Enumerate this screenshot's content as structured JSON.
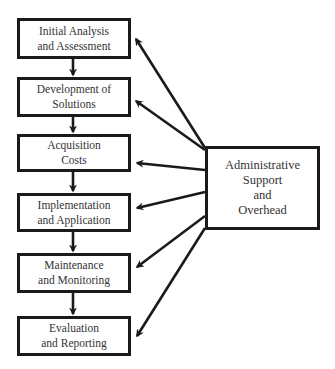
{
  "diagram": {
    "type": "process-flow",
    "stroke_color": "#1a1a1a",
    "text_color": "#333333",
    "background": "#ffffff",
    "steps": [
      {
        "id": "step-1",
        "line1": "Initial Analysis",
        "line2": "and Assessment"
      },
      {
        "id": "step-2",
        "line1": "Development of",
        "line2": "Solutions"
      },
      {
        "id": "step-3",
        "line1": "Acquisition",
        "line2": "Costs"
      },
      {
        "id": "step-4",
        "line1": "Implementation",
        "line2": "and Application"
      },
      {
        "id": "step-5",
        "line1": "Maintenance",
        "line2": "and Monitoring"
      },
      {
        "id": "step-6",
        "line1": "Evaluation",
        "line2": "and Reporting"
      }
    ],
    "support": {
      "id": "admin",
      "lines": [
        "Administrative",
        "Support",
        "and",
        "Overhead"
      ]
    },
    "edges": [
      {
        "from": "step-1",
        "to": "step-2"
      },
      {
        "from": "step-2",
        "to": "step-3"
      },
      {
        "from": "step-3",
        "to": "step-4"
      },
      {
        "from": "step-4",
        "to": "step-5"
      },
      {
        "from": "step-5",
        "to": "step-6"
      },
      {
        "from": "admin",
        "to": "step-1"
      },
      {
        "from": "admin",
        "to": "step-2"
      },
      {
        "from": "admin",
        "to": "step-3"
      },
      {
        "from": "admin",
        "to": "step-4"
      },
      {
        "from": "admin",
        "to": "step-5"
      },
      {
        "from": "admin",
        "to": "step-6"
      }
    ]
  }
}
